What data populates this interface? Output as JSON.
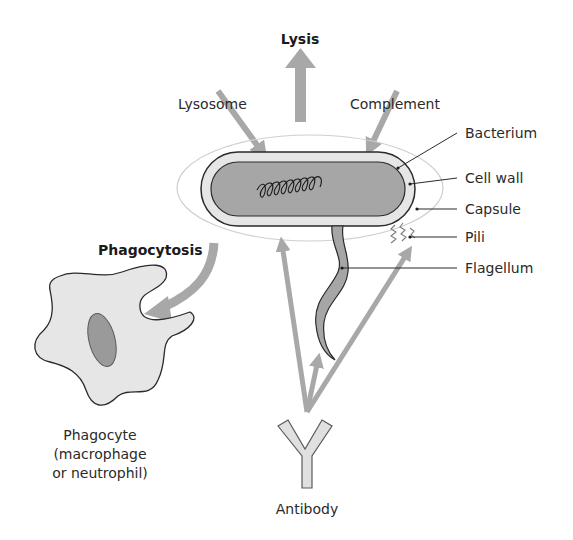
{
  "diagram": {
    "labels": {
      "lysis": "Lysis",
      "lysosome": "Lysosome",
      "complement": "Complement",
      "bacterium": "Bacterium",
      "cell_wall": "Cell wall",
      "capsule": "Capsule",
      "pili": "Pili",
      "flagellum": "Flagellum",
      "phagocytosis": "Phagocytosis",
      "phagocyte_line1": "Phagocyte",
      "phagocyte_line2": "(macrophage",
      "phagocyte_line3": "or neutrophil)",
      "antibody": "Antibody"
    },
    "colors": {
      "arrow": "#a8a8a8",
      "cell_fill": "#e6e6e6",
      "cytoplasm": "#a6a6a6",
      "outline": "#2a2a2a",
      "capsule_line": "#c8c8c8",
      "nucleus": "#9a9a9a"
    }
  }
}
